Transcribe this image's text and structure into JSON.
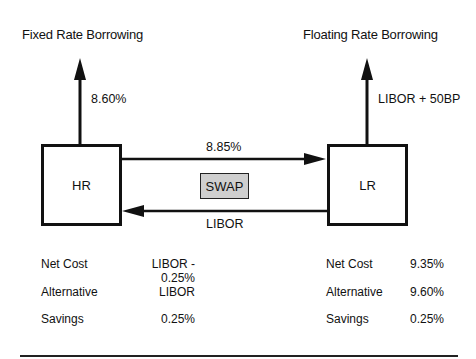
{
  "left": {
    "title": "Fixed Rate Borrowing",
    "rate_label": "8.60%",
    "entity": "HR",
    "summary": [
      {
        "label": "Net Cost",
        "value": "LIBOR - 0.25%"
      },
      {
        "label": "Alternative",
        "value": "LIBOR"
      },
      {
        "label": "Savings",
        "value": "0.25%"
      }
    ]
  },
  "right": {
    "title": "Floating Rate Borrowing",
    "rate_label": "LIBOR + 50BP",
    "entity": "LR",
    "summary": [
      {
        "label": "Net Cost",
        "value": "9.35%"
      },
      {
        "label": "Alternative",
        "value": "9.60%"
      },
      {
        "label": "Savings",
        "value": "0.25%"
      }
    ]
  },
  "swap": {
    "label": "SWAP",
    "fixed_leg_label": "8.85%",
    "floating_leg_label": "LIBOR",
    "box_color": "#cfcfcf"
  }
}
